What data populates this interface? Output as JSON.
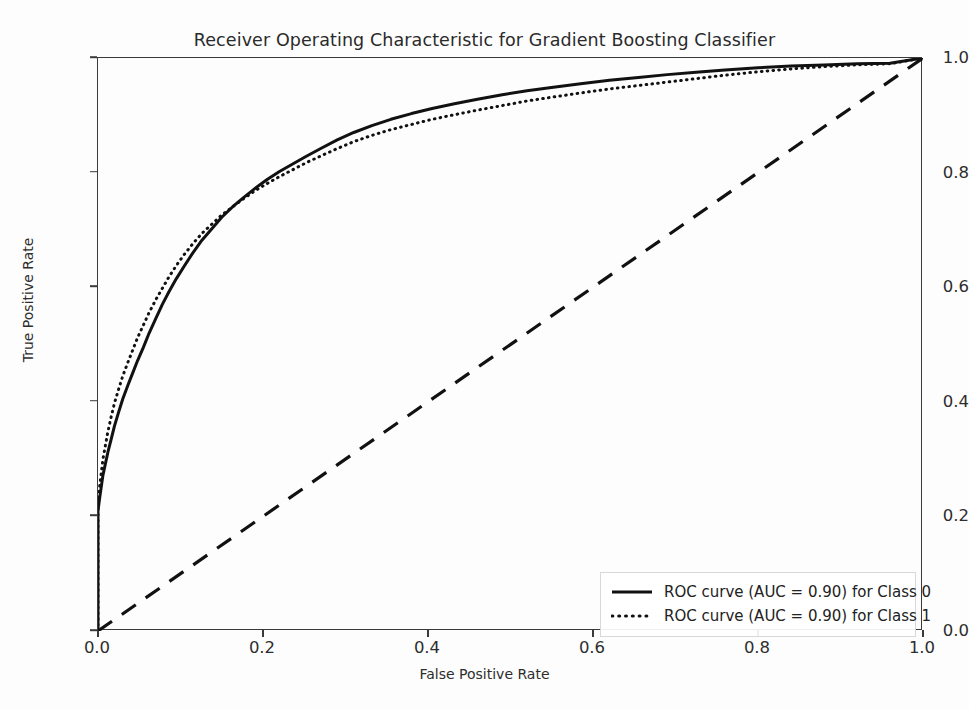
{
  "chart_data": {
    "type": "line",
    "title": "Receiver Operating Characteristic for Gradient Boosting Classifier",
    "xlabel": "False Positive Rate",
    "ylabel": "True Positive Rate",
    "xlim": [
      0.0,
      1.0
    ],
    "ylim": [
      0.0,
      1.0
    ],
    "xticks": [
      "0.0",
      "0.2",
      "0.4",
      "0.6",
      "0.8",
      "1.0"
    ],
    "yticks": [
      "0.0",
      "0.2",
      "0.4",
      "0.6",
      "0.8",
      "1.0"
    ],
    "xtick_values": [
      0.0,
      0.2,
      0.4,
      0.6,
      0.8,
      1.0
    ],
    "ytick_values": [
      0.0,
      0.2,
      0.4,
      0.6,
      0.8,
      1.0
    ],
    "grid": false,
    "legend_position": "lower right",
    "line_color": "#111111",
    "series": [
      {
        "name": "ROC curve (AUC = 0.90) for Class 0",
        "auc": 0.9,
        "style": "solid",
        "x": [
          0.0,
          0.0,
          0.002,
          0.004,
          0.006,
          0.009,
          0.012,
          0.016,
          0.02,
          0.025,
          0.03,
          0.036,
          0.042,
          0.048,
          0.055,
          0.062,
          0.07,
          0.078,
          0.086,
          0.095,
          0.105,
          0.115,
          0.126,
          0.138,
          0.15,
          0.163,
          0.176,
          0.19,
          0.205,
          0.22,
          0.236,
          0.252,
          0.27,
          0.29,
          0.31,
          0.332,
          0.355,
          0.38,
          0.405,
          0.432,
          0.46,
          0.49,
          0.52,
          0.552,
          0.585,
          0.62,
          0.655,
          0.69,
          0.725,
          0.76,
          0.8,
          0.84,
          0.88,
          0.92,
          0.96,
          1.0
        ],
        "y": [
          0.0,
          0.21,
          0.232,
          0.252,
          0.272,
          0.292,
          0.312,
          0.335,
          0.358,
          0.382,
          0.405,
          0.428,
          0.45,
          0.472,
          0.495,
          0.52,
          0.545,
          0.57,
          0.592,
          0.615,
          0.638,
          0.66,
          0.682,
          0.702,
          0.722,
          0.74,
          0.756,
          0.772,
          0.788,
          0.802,
          0.815,
          0.828,
          0.842,
          0.857,
          0.87,
          0.882,
          0.893,
          0.903,
          0.912,
          0.92,
          0.928,
          0.936,
          0.943,
          0.949,
          0.955,
          0.961,
          0.966,
          0.971,
          0.975,
          0.979,
          0.983,
          0.986,
          0.988,
          0.99,
          0.991,
          1.0
        ]
      },
      {
        "name": "ROC curve (AUC = 0.90) for Class 1",
        "auc": 0.9,
        "style": "dotted",
        "x": [
          0.0,
          0.0,
          0.002,
          0.004,
          0.006,
          0.009,
          0.012,
          0.016,
          0.02,
          0.025,
          0.03,
          0.036,
          0.042,
          0.048,
          0.055,
          0.062,
          0.07,
          0.078,
          0.086,
          0.095,
          0.105,
          0.115,
          0.126,
          0.138,
          0.15,
          0.163,
          0.176,
          0.19,
          0.205,
          0.22,
          0.236,
          0.252,
          0.27,
          0.29,
          0.31,
          0.332,
          0.355,
          0.38,
          0.405,
          0.432,
          0.46,
          0.49,
          0.52,
          0.552,
          0.585,
          0.62,
          0.655,
          0.69,
          0.725,
          0.76,
          0.8,
          0.84,
          0.88,
          0.92,
          0.96,
          1.0
        ],
        "y": [
          0.0,
          0.225,
          0.252,
          0.276,
          0.3,
          0.324,
          0.348,
          0.374,
          0.398,
          0.422,
          0.445,
          0.468,
          0.49,
          0.512,
          0.534,
          0.556,
          0.578,
          0.598,
          0.618,
          0.638,
          0.658,
          0.676,
          0.694,
          0.71,
          0.726,
          0.74,
          0.754,
          0.768,
          0.781,
          0.793,
          0.805,
          0.817,
          0.829,
          0.842,
          0.854,
          0.865,
          0.875,
          0.884,
          0.893,
          0.901,
          0.909,
          0.917,
          0.925,
          0.932,
          0.939,
          0.946,
          0.952,
          0.958,
          0.964,
          0.97,
          0.976,
          0.981,
          0.985,
          0.988,
          0.99,
          1.0
        ]
      }
    ],
    "reference_line": {
      "name": "chance-diagonal",
      "style": "dashed",
      "x": [
        0.0,
        1.0
      ],
      "y": [
        0.0,
        1.0
      ]
    }
  },
  "legend": {
    "entries": [
      {
        "label": "ROC curve (AUC = 0.90) for Class 0",
        "style": "solid"
      },
      {
        "label": "ROC curve (AUC = 0.90) for Class 1",
        "style": "dotted"
      }
    ]
  }
}
